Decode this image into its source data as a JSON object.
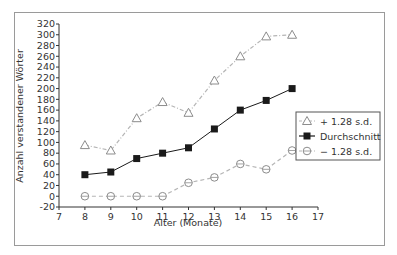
{
  "chart_data": {
    "type": "line",
    "title": "",
    "xlabel": "Alter (Monate)",
    "ylabel": "Anzahl verstandener Wörter",
    "xlim": [
      7,
      17
    ],
    "ylim": [
      -20,
      320
    ],
    "x_ticks": [
      7,
      8,
      9,
      10,
      11,
      12,
      13,
      14,
      15,
      16,
      17
    ],
    "y_ticks": [
      -20,
      0,
      20,
      40,
      60,
      80,
      100,
      120,
      140,
      160,
      180,
      200,
      220,
      240,
      260,
      280,
      300,
      320
    ],
    "grid": false,
    "legend_position": "right-center",
    "x": [
      8,
      9,
      10,
      11,
      12,
      13,
      14,
      15,
      16
    ],
    "series": [
      {
        "name": "+ 1.28 s.d.",
        "marker": "triangle-open",
        "line": "dash-dot",
        "color": "#b5b5b5",
        "values": [
          95,
          85,
          145,
          175,
          155,
          215,
          260,
          297,
          300
        ]
      },
      {
        "name": "Durchschnitt",
        "marker": "square-filled",
        "line": "solid",
        "color": "#1a1a1a",
        "values": [
          40,
          45,
          70,
          80,
          90,
          125,
          160,
          178,
          200
        ]
      },
      {
        "name": "− 1.28 s.d.",
        "marker": "circle-open",
        "line": "dashed",
        "color": "#b5b5b5",
        "values": [
          0,
          0,
          0,
          0,
          25,
          35,
          60,
          50,
          85
        ]
      }
    ]
  }
}
